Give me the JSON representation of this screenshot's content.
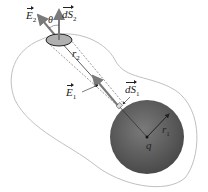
{
  "diagram": {
    "labels": {
      "E2": {
        "symbol": "E",
        "sub": "2"
      },
      "dS2": {
        "symbol": "dS",
        "sub": "2"
      },
      "theta": "θ",
      "r2": {
        "symbol": "r",
        "sub": "2"
      },
      "E1": {
        "symbol": "E",
        "sub": "1"
      },
      "dS1": {
        "symbol": "dS",
        "sub": "1"
      },
      "r1": {
        "symbol": "r",
        "sub": "1"
      },
      "q": "q"
    },
    "colors": {
      "sphere": "#5a5a5a",
      "surface_outline": "#b8b8b8",
      "arrow": "#7a7a7a",
      "patch": "#b0b0b0"
    }
  }
}
